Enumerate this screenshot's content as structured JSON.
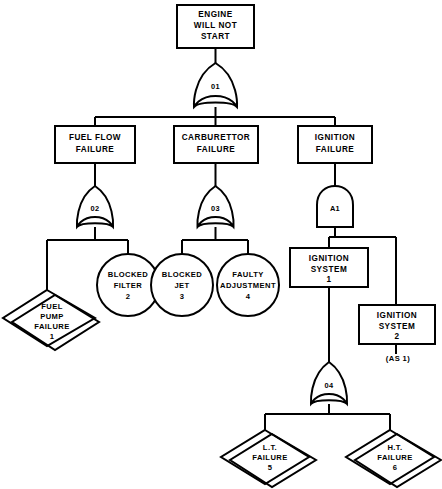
{
  "diagram": {
    "line_color": "#000000",
    "fill_color": "#ffffff"
  },
  "nodes": {
    "top_event": {
      "line1": "ENGINE",
      "line2": "WILL NOT",
      "line3": "START"
    },
    "fuel_flow": {
      "line1": "FUEL FLOW",
      "line2": "FAILURE"
    },
    "carburettor": {
      "line1": "CARBURETTOR",
      "line2": "FAILURE"
    },
    "ignition": {
      "line1": "IGNITION",
      "line2": "FAILURE"
    },
    "ignition_system_1": {
      "line1": "IGNITION",
      "line2": "SYSTEM",
      "line3": "1"
    },
    "ignition_system_2": {
      "line1": "IGNITION",
      "line2": "SYSTEM",
      "line3": "2",
      "note": "(AS 1)"
    },
    "blocked_filter": {
      "line1": "BLOCKED",
      "line2": "FILTER",
      "line3": "2"
    },
    "blocked_jet": {
      "line1": "BLOCKED",
      "line2": "JET",
      "line3": "3"
    },
    "faulty_adjustment": {
      "line1": "FAULTY",
      "line2": "ADJUSTMENT",
      "line3": "4"
    },
    "fuel_pump_failure": {
      "line1": "FUEL",
      "line2": "PUMP",
      "line3": "FAILURE",
      "line4": "1"
    },
    "lt_failure": {
      "line1": "L.T.",
      "line2": "FAILURE",
      "line3": "5"
    },
    "ht_failure": {
      "line1": "H.T.",
      "line2": "FAILURE",
      "line3": "6"
    }
  },
  "gates": {
    "g1": {
      "label": "01",
      "type": "or"
    },
    "g2": {
      "label": "02",
      "type": "or"
    },
    "g3": {
      "label": "03",
      "type": "or"
    },
    "g4": {
      "label": "04",
      "type": "or"
    },
    "a1": {
      "label": "A1",
      "type": "and"
    }
  }
}
